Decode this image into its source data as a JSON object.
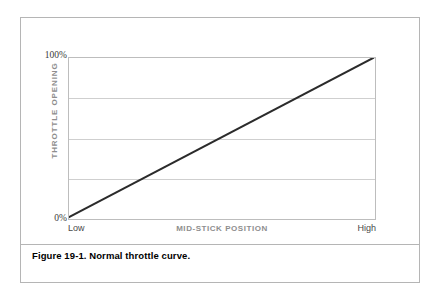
{
  "figure": {
    "caption": "Figure 19-1. Normal throttle curve."
  },
  "chart_data": {
    "type": "line",
    "title": "",
    "xlabel": "MID-STICK POSITION",
    "ylabel": "THROTTLE OPENING",
    "x": [
      0,
      100
    ],
    "values": [
      0,
      100
    ],
    "series": [
      {
        "name": "Normal throttle curve",
        "values": [
          0,
          100
        ]
      }
    ],
    "xlim": [
      0,
      100
    ],
    "ylim": [
      0,
      100
    ],
    "x_tick_labels": [
      "Low",
      "High"
    ],
    "y_tick_labels": [
      "0%",
      "100%"
    ],
    "y_ticks": [
      0,
      100
    ],
    "gridlines_y": [
      25,
      50,
      75
    ],
    "grid": true,
    "legend": "none",
    "line_color": "#2b2b2b",
    "grid_color": "#cfcfcf",
    "axis_color": "#bdbdbd",
    "label_color": "#8e8e8e"
  },
  "axes": {
    "y_tick_top": "100%",
    "y_tick_bottom": "0%",
    "y_title": "THROTTLE OPENING",
    "x_title": "MID-STICK POSITION",
    "x_tick_left": "Low",
    "x_tick_right": "High"
  }
}
